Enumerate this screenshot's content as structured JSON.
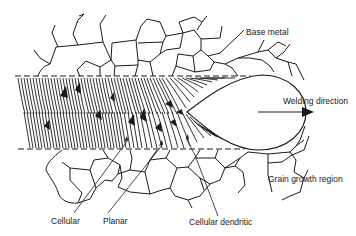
{
  "diagram": {
    "labels": {
      "base_metal": "Base metal",
      "welding_direction": "Welding direction",
      "grain_growth_region": "Grain growth region",
      "cellular": "Cellular",
      "planar": "Planar",
      "cellular_dendritic": "Cellular dendritic"
    },
    "colors": {
      "ink": "#1a1a1a",
      "background": "#ffffff"
    },
    "elements": [
      "base-metal-grains",
      "fusion-boundary-dashed-lines",
      "columnar-solidification-zone",
      "weld-pool",
      "welding-direction-arrow",
      "leader-lines"
    ]
  }
}
